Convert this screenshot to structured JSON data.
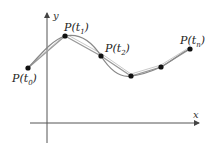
{
  "diagram": {
    "type": "parametric-curve-interpolation",
    "axes": {
      "x_label": "x",
      "y_label": "y",
      "origin": [
        47,
        123
      ],
      "x_range": [
        30,
        199
      ],
      "y_range": [
        143,
        12
      ]
    },
    "points": [
      {
        "id": "p0",
        "label": "P(t0)",
        "base": "P(t",
        "sub": "0",
        "close": ")",
        "x": 28,
        "y": 68
      },
      {
        "id": "p1",
        "label": "P(t1)",
        "base": "P(t",
        "sub": "1",
        "close": ")",
        "x": 65,
        "y": 36
      },
      {
        "id": "p2",
        "label": "P(t2)",
        "base": "P(t",
        "sub": "2",
        "close": ")",
        "x": 101,
        "y": 56
      },
      {
        "id": "p3",
        "label": "",
        "x": 131,
        "y": 76
      },
      {
        "id": "p4",
        "label": "",
        "x": 161,
        "y": 67
      },
      {
        "id": "pn",
        "label": "P(tn)",
        "base": "P(t",
        "sub": "n",
        "close": ")",
        "x": 190,
        "y": 49
      }
    ],
    "colors": {
      "axis": "#555555",
      "curve": "#888888",
      "chord": "#999999",
      "point": "#111111",
      "text": "#222222"
    }
  }
}
